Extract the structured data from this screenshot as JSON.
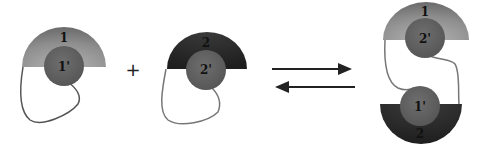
{
  "diagram": {
    "monomer_a": {
      "outer_label": "1",
      "inner_label": "1'"
    },
    "operator": "+",
    "monomer_b": {
      "outer_label": "2",
      "inner_label": "2'"
    },
    "equilibrium": {
      "forward_arrow": "→",
      "reverse_arrow": "←"
    },
    "dimer": {
      "top": {
        "outer_label": "1",
        "inner_label": "2'"
      },
      "bottom": {
        "outer_label": "2",
        "inner_label": "1'"
      }
    },
    "colors": {
      "light_domain": "#8a8a8a",
      "dark_domain": "#2b2b2b",
      "inner_circle": "#5e5e5e",
      "linker": "#555555",
      "arrow": "#222222"
    }
  }
}
